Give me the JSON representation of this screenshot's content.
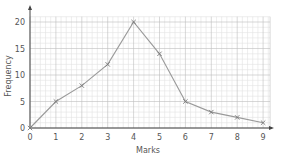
{
  "chart_data": {
    "type": "line",
    "title": "",
    "xlabel": "Marks",
    "ylabel": "Frequency",
    "x": [
      0,
      1,
      2,
      3,
      4,
      5,
      6,
      7,
      8,
      9
    ],
    "series": [
      {
        "name": "Frequency polygon",
        "values": [
          0,
          5,
          8,
          12,
          20,
          14,
          5,
          3,
          2,
          1
        ]
      }
    ],
    "xticks": [
      "0",
      "1",
      "2",
      "3",
      "4",
      "5",
      "6",
      "7",
      "8",
      "9"
    ],
    "yticks": [
      "0",
      "5",
      "10",
      "15",
      "20"
    ],
    "xlim": [
      0,
      9
    ],
    "ylim": [
      0,
      20
    ],
    "grid": true,
    "marker": "x",
    "colors": {
      "line": "#9a9a9a",
      "grid_major": "#bdbdbd",
      "grid_minor": "#e2e2e2",
      "axis": "#444444"
    }
  }
}
